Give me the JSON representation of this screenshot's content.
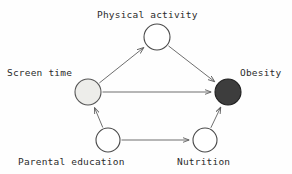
{
  "diagram": {
    "type": "directed-acyclic-graph",
    "background_color": "#fefefe",
    "edge_color": "#6f6f6f",
    "outline_color": "#3a3a3a",
    "nodes": [
      {
        "id": "physical_activity",
        "label": "Physical activity",
        "cx": 157,
        "cy": 37,
        "r": 13,
        "fill": "#ffffff",
        "stroke": "#4a4a4a",
        "label_x": 97,
        "label_y": 10
      },
      {
        "id": "screen_time",
        "label": "Screen time",
        "cx": 88,
        "cy": 92,
        "r": 13,
        "fill": "#ededea",
        "stroke": "#555555",
        "label_x": 7,
        "label_y": 68
      },
      {
        "id": "obesity",
        "label": "Obesity",
        "cx": 228,
        "cy": 92,
        "r": 13,
        "fill": "#3d3d3d",
        "stroke": "#1f1f1f",
        "label_x": 240,
        "label_y": 68
      },
      {
        "id": "parental_education",
        "label": "Parental education",
        "cx": 108,
        "cy": 140,
        "r": 12,
        "fill": "#ffffff",
        "stroke": "#4a4a4a",
        "label_x": 18,
        "label_y": 157
      },
      {
        "id": "nutrition",
        "label": "Nutrition",
        "cx": 205,
        "cy": 140,
        "r": 12,
        "fill": "#ffffff",
        "stroke": "#4a4a4a",
        "label_x": 177,
        "label_y": 157
      }
    ],
    "edges": [
      {
        "id": "screen_time-to-physical_activity",
        "from": "screen_time",
        "to": "physical_activity"
      },
      {
        "id": "screen_time-to-obesity",
        "from": "screen_time",
        "to": "obesity"
      },
      {
        "id": "physical_activity-to-obesity",
        "from": "physical_activity",
        "to": "obesity"
      },
      {
        "id": "parental_education-to-screen_time",
        "from": "parental_education",
        "to": "screen_time"
      },
      {
        "id": "parental_education-to-nutrition",
        "from": "parental_education",
        "to": "nutrition"
      },
      {
        "id": "nutrition-to-obesity",
        "from": "nutrition",
        "to": "obesity"
      }
    ]
  }
}
